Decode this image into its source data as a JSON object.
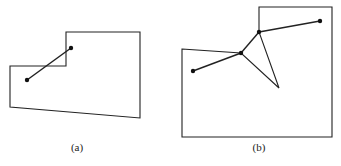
{
  "figures": [
    {
      "label": "(a)",
      "polygon": [
        [
          10,
          66
        ],
        [
          66,
          66
        ],
        [
          66,
          32
        ],
        [
          140,
          32
        ],
        [
          140,
          118
        ],
        [
          10,
          107
        ]
      ],
      "segments": [
        [
          [
            27,
            80
          ],
          [
            71,
            48
          ]
        ]
      ],
      "points": [
        [
          27,
          80
        ],
        [
          71,
          48
        ]
      ],
      "label_pos": [
        77,
        151
      ]
    },
    {
      "label": "(b)",
      "polygon": [
        [
          182,
          49
        ],
        [
          241,
          53
        ],
        [
          279,
          88
        ],
        [
          259,
          32
        ],
        [
          259,
          7
        ],
        [
          332,
          7
        ],
        [
          332,
          137
        ],
        [
          182,
          137
        ]
      ],
      "segments": [
        [
          [
            193,
            71
          ],
          [
            241,
            53
          ]
        ],
        [
          [
            241,
            53
          ],
          [
            259,
            32
          ]
        ],
        [
          [
            259,
            32
          ],
          [
            320,
            21
          ]
        ]
      ],
      "points": [
        [
          193,
          71
        ],
        [
          241,
          53
        ],
        [
          259,
          32
        ],
        [
          320,
          21
        ]
      ],
      "label_pos": [
        259,
        151
      ]
    }
  ]
}
